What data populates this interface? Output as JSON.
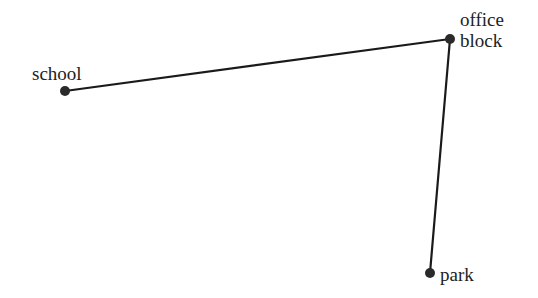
{
  "diagram": {
    "type": "route-map",
    "colors": {
      "line": "#1a1a1a",
      "point": "#2a2a2a",
      "text": "#222222",
      "background": "#ffffff"
    },
    "points": [
      {
        "id": "school",
        "label": "school",
        "x": 65,
        "y": 91
      },
      {
        "id": "office-block",
        "label_line1": "office",
        "label_line2": "block",
        "x": 450,
        "y": 39
      },
      {
        "id": "park",
        "label": "park",
        "x": 430,
        "y": 273
      }
    ],
    "segments": [
      {
        "from": "school",
        "to": "office-block"
      },
      {
        "from": "office-block",
        "to": "park"
      }
    ]
  }
}
